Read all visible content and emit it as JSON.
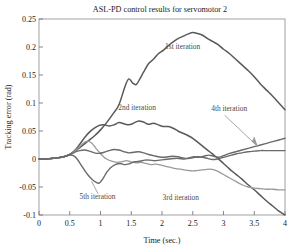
{
  "chart_data": {
    "type": "line",
    "title": "ASL-PD control results for servomotor 2",
    "xlabel": "Time (sec.)",
    "ylabel": "Tracking error (rad)",
    "xlim": [
      0,
      4
    ],
    "ylim": [
      -0.1,
      0.25
    ],
    "xticks": [
      "0",
      "0.5",
      "1",
      "1.5",
      "2",
      "2.5",
      "3",
      "3.5",
      "4"
    ],
    "xtick_values": [
      0,
      0.5,
      1,
      1.5,
      2,
      2.5,
      3,
      3.5,
      4
    ],
    "yticks": [
      "0.25",
      "0.2",
      "0.15",
      "0.1",
      "0.05",
      "0",
      "-0.05",
      "-0.1"
    ],
    "ytick_values": [
      0.25,
      0.2,
      0.15,
      0.1,
      0.05,
      0,
      -0.05,
      -0.1
    ],
    "grid": false,
    "legend": "inline-annotations",
    "annotations": [
      {
        "name": "1st iteration",
        "x": 2.05,
        "y": 0.197,
        "leader": false
      },
      {
        "name": "2nd iteration",
        "x": 1.29,
        "y": 0.087,
        "leader": false
      },
      {
        "name": "4th iteration",
        "x": 2.8,
        "y": 0.086,
        "leader": true
      },
      {
        "name": "5th iteration",
        "x": 0.66,
        "y": -0.072,
        "leader": true
      },
      {
        "name": "3rd iteration",
        "x": 2.01,
        "y": -0.074,
        "leader": false
      }
    ],
    "series": [
      {
        "name": "1st iteration",
        "color": "#595959",
        "width": 1.5,
        "x": [
          0.0,
          0.1,
          0.2,
          0.3,
          0.4,
          0.5,
          0.58,
          0.66,
          0.74,
          0.82,
          0.9,
          1.0,
          1.1,
          1.2,
          1.3,
          1.4,
          1.46,
          1.52,
          1.58,
          1.64,
          1.7,
          1.78,
          1.86,
          1.94,
          2.02,
          2.1,
          2.18,
          2.26,
          2.34,
          2.42,
          2.5,
          2.58,
          2.66,
          2.74,
          2.82,
          2.9,
          3.0,
          3.1,
          3.2,
          3.3,
          3.4,
          3.5,
          3.6,
          3.7,
          3.8,
          3.9,
          4.0
        ],
        "y": [
          0.0,
          0.0,
          0.001,
          0.002,
          0.004,
          0.008,
          0.014,
          0.02,
          0.027,
          0.034,
          0.041,
          0.052,
          0.065,
          0.08,
          0.097,
          0.13,
          0.143,
          0.136,
          0.133,
          0.143,
          0.155,
          0.17,
          0.178,
          0.188,
          0.194,
          0.202,
          0.209,
          0.215,
          0.219,
          0.223,
          0.226,
          0.224,
          0.221,
          0.215,
          0.21,
          0.205,
          0.196,
          0.188,
          0.178,
          0.168,
          0.158,
          0.147,
          0.134,
          0.123,
          0.112,
          0.1,
          0.088
        ]
      },
      {
        "name": "2nd iteration",
        "color": "#595959",
        "width": 1.5,
        "x": [
          0.0,
          0.1,
          0.2,
          0.3,
          0.4,
          0.5,
          0.58,
          0.66,
          0.74,
          0.82,
          0.9,
          0.98,
          1.06,
          1.14,
          1.22,
          1.3,
          1.38,
          1.46,
          1.54,
          1.62,
          1.7,
          1.78,
          1.86,
          1.94,
          2.02,
          2.1,
          2.18,
          2.26,
          2.34,
          2.42,
          2.5,
          2.58,
          2.66,
          2.74,
          2.82,
          2.9,
          3.0,
          3.1,
          3.2,
          3.3,
          3.4,
          3.5,
          3.6,
          3.7,
          3.8,
          3.9,
          4.0
        ],
        "y": [
          0.0,
          0.0,
          0.001,
          0.002,
          0.004,
          0.008,
          0.015,
          0.026,
          0.038,
          0.048,
          0.055,
          0.06,
          0.061,
          0.059,
          0.061,
          0.065,
          0.063,
          0.061,
          0.064,
          0.068,
          0.066,
          0.062,
          0.064,
          0.061,
          0.058,
          0.058,
          0.055,
          0.05,
          0.046,
          0.042,
          0.037,
          0.03,
          0.023,
          0.016,
          0.009,
          0.002,
          -0.008,
          -0.018,
          -0.027,
          -0.036,
          -0.046,
          -0.055,
          -0.065,
          -0.075,
          -0.084,
          -0.093,
          -0.1
        ]
      },
      {
        "name": "3rd iteration",
        "color": "#9a9a9a",
        "width": 1.3,
        "x": [
          0.0,
          0.1,
          0.2,
          0.3,
          0.4,
          0.5,
          0.58,
          0.66,
          0.74,
          0.8,
          0.86,
          0.92,
          0.98,
          1.04,
          1.1,
          1.18,
          1.26,
          1.34,
          1.42,
          1.5,
          1.58,
          1.66,
          1.74,
          1.82,
          1.9,
          1.98,
          2.06,
          2.14,
          2.22,
          2.3,
          2.38,
          2.46,
          2.54,
          2.62,
          2.7,
          2.78,
          2.86,
          2.94,
          3.02,
          3.1,
          3.2,
          3.3,
          3.4,
          3.5,
          3.6,
          3.7,
          3.8,
          3.9,
          4.0
        ],
        "y": [
          0.0,
          0.0,
          0.001,
          0.002,
          0.004,
          0.008,
          0.014,
          0.022,
          0.03,
          0.032,
          0.028,
          0.02,
          0.012,
          0.005,
          0.0,
          -0.004,
          -0.006,
          -0.005,
          -0.003,
          -0.005,
          -0.007,
          -0.006,
          -0.008,
          -0.01,
          -0.009,
          -0.011,
          -0.013,
          -0.015,
          -0.017,
          -0.018,
          -0.02,
          -0.021,
          -0.021,
          -0.02,
          -0.019,
          -0.018,
          -0.02,
          -0.024,
          -0.029,
          -0.034,
          -0.04,
          -0.046,
          -0.05,
          -0.052,
          -0.053,
          -0.054,
          -0.054,
          -0.055,
          -0.055
        ]
      },
      {
        "name": "4th iteration",
        "color": "#6a6a6a",
        "width": 1.4,
        "x": [
          0.0,
          0.1,
          0.2,
          0.3,
          0.4,
          0.5,
          0.58,
          0.66,
          0.74,
          0.82,
          0.9,
          0.98,
          1.06,
          1.14,
          1.22,
          1.3,
          1.38,
          1.46,
          1.54,
          1.62,
          1.7,
          1.78,
          1.86,
          1.94,
          2.02,
          2.1,
          2.18,
          2.26,
          2.34,
          2.42,
          2.5,
          2.58,
          2.66,
          2.74,
          2.82,
          2.9,
          3.0,
          3.1,
          3.2,
          3.3,
          3.4,
          3.5,
          3.6,
          3.7,
          3.8,
          3.9,
          4.0
        ],
        "y": [
          0.0,
          0.0,
          0.001,
          0.002,
          0.004,
          0.008,
          0.012,
          0.015,
          0.016,
          0.014,
          0.011,
          0.01,
          0.012,
          0.015,
          0.017,
          0.016,
          0.013,
          0.011,
          0.012,
          0.013,
          0.011,
          0.008,
          0.006,
          0.004,
          0.003,
          0.004,
          0.005,
          0.004,
          0.002,
          0.001,
          0.002,
          0.004,
          0.003,
          0.001,
          -0.001,
          0.0,
          0.003,
          0.006,
          0.009,
          0.011,
          0.013,
          0.014,
          0.015,
          0.015,
          0.015,
          0.015,
          0.015
        ]
      },
      {
        "name": "5th iteration",
        "color": "#6a6a6a",
        "width": 1.4,
        "x": [
          0.0,
          0.1,
          0.2,
          0.3,
          0.4,
          0.5,
          0.56,
          0.62,
          0.68,
          0.74,
          0.8,
          0.86,
          0.92,
          0.98,
          1.04,
          1.1,
          1.16,
          1.24,
          1.32,
          1.4,
          1.48,
          1.56,
          1.64,
          1.72,
          1.8,
          1.88,
          1.96,
          2.04,
          2.12,
          2.2,
          2.28,
          2.36,
          2.44,
          2.52,
          2.6,
          2.68,
          2.76,
          2.84,
          2.92,
          3.0,
          3.1,
          3.2,
          3.3,
          3.4,
          3.5,
          3.6,
          3.7,
          3.8,
          3.9,
          4.0
        ],
        "y": [
          0.0,
          0.0,
          0.001,
          0.002,
          0.004,
          0.007,
          0.006,
          0.0,
          -0.01,
          -0.02,
          -0.029,
          -0.036,
          -0.041,
          -0.043,
          -0.035,
          -0.024,
          -0.016,
          -0.01,
          -0.008,
          -0.01,
          -0.008,
          -0.005,
          -0.004,
          -0.002,
          -0.002,
          -0.003,
          -0.002,
          -0.001,
          0.0,
          0.001,
          0.001,
          0.0,
          0.002,
          0.004,
          0.003,
          0.005,
          0.007,
          0.005,
          0.003,
          0.006,
          0.01,
          0.013,
          0.016,
          0.019,
          0.022,
          0.025,
          0.028,
          0.031,
          0.034,
          0.037
        ]
      }
    ]
  }
}
